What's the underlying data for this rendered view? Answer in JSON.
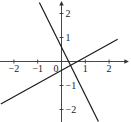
{
  "chart_data": {
    "type": "line",
    "title": "",
    "xlabel": "",
    "ylabel": "",
    "xlim": [
      -2.6,
      2.8
    ],
    "ylim": [
      -2.6,
      2.6
    ],
    "grid": false,
    "legend": null,
    "x_ticks": [
      -2,
      -1,
      1,
      2
    ],
    "x_tick_labels": [
      "−2",
      "−1",
      "1",
      "2"
    ],
    "y_ticks": [
      2,
      1,
      -1,
      -2
    ],
    "y_tick_labels": [
      "2",
      "1",
      "−1",
      "−2"
    ],
    "origin_label": "0",
    "series": [
      {
        "name": "steep line",
        "slope": -2,
        "intercept": 0.6,
        "x": [
          -0.93,
          1.55
        ],
        "y": [
          2.46,
          -2.5
        ]
      },
      {
        "name": "shallow line",
        "slope": 0.55,
        "intercept": -0.37,
        "x": [
          -2.55,
          2.36
        ],
        "y": [
          -1.77,
          0.93
        ]
      }
    ]
  }
}
